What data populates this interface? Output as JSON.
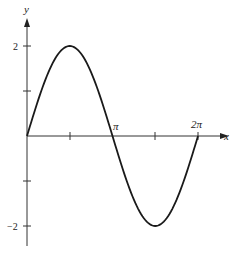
{
  "chart_data": {
    "type": "line",
    "title": "",
    "function": "y = 2 sin x",
    "xlabel": "x",
    "ylabel": "y",
    "x_ticks": [
      "π/2",
      "π",
      "3π/2",
      "2π"
    ],
    "x_tick_labels": {
      "pi": "π",
      "two_pi": "2π"
    },
    "y_tick_labels": {
      "pos2": "2",
      "neg2": "−2"
    },
    "xlim": [
      0,
      6.2832
    ],
    "ylim": [
      -2.4,
      2.5
    ],
    "grid": false,
    "legend": null,
    "series": [
      {
        "name": "2 sin x",
        "x": [
          0,
          0.7854,
          1.5708,
          2.3562,
          3.1416,
          3.927,
          4.7124,
          5.4978,
          6.2832
        ],
        "values": [
          0,
          1.414,
          2,
          1.414,
          0,
          -1.414,
          -2,
          -1.414,
          0
        ]
      }
    ],
    "color": "#1a1a1a"
  }
}
